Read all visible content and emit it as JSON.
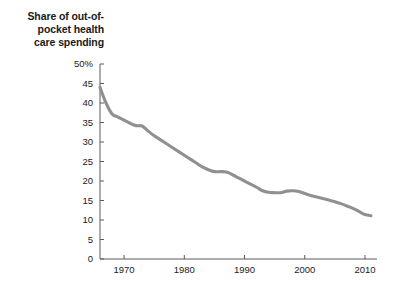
{
  "chart_data": {
    "type": "line",
    "title_lines": [
      "Share of out-of-",
      "pocket health",
      "care spending"
    ],
    "xlabel": "",
    "ylabel": "",
    "xlim": [
      1966,
      2012
    ],
    "ylim": [
      0,
      50
    ],
    "grid": false,
    "legend": "none",
    "y_ticks": [
      0,
      5,
      10,
      15,
      20,
      25,
      30,
      35,
      40,
      45,
      50
    ],
    "y_tick_labels": [
      "0",
      "5",
      "10",
      "15",
      "20",
      "25",
      "30",
      "35",
      "40",
      "45",
      "50%"
    ],
    "x_ticks": [
      1970,
      1980,
      1990,
      2000,
      2010
    ],
    "x_tick_labels": [
      "1970",
      "1980",
      "1990",
      "2000",
      "2010"
    ],
    "series": [
      {
        "name": "Share of out-of-pocket health care spending",
        "color": "#909090",
        "x": [
          1966,
          1967,
          1968,
          1969,
          1970,
          1971,
          1972,
          1973,
          1974,
          1975,
          1976,
          1977,
          1978,
          1979,
          1980,
          1981,
          1982,
          1983,
          1984,
          1985,
          1986,
          1987,
          1988,
          1989,
          1990,
          1991,
          1992,
          1993,
          1994,
          1995,
          1996,
          1997,
          1998,
          1999,
          2000,
          2001,
          2002,
          2003,
          2004,
          2005,
          2006,
          2007,
          2008,
          2009,
          2010,
          2011
        ],
        "values": [
          44.0,
          40.0,
          37.2,
          36.4,
          35.6,
          34.8,
          34.2,
          34.1,
          32.8,
          31.6,
          30.6,
          29.6,
          28.6,
          27.6,
          26.6,
          25.6,
          24.6,
          23.6,
          22.9,
          22.4,
          22.4,
          22.3,
          21.6,
          20.8,
          20.0,
          19.2,
          18.4,
          17.5,
          17.1,
          17.0,
          17.0,
          17.4,
          17.5,
          17.3,
          16.8,
          16.3,
          15.9,
          15.5,
          15.1,
          14.7,
          14.2,
          13.6,
          13.0,
          12.2,
          11.4,
          11.1
        ]
      }
    ]
  },
  "axis": {
    "y_axis_name": "y-axis",
    "x_axis_name": "x-axis"
  }
}
